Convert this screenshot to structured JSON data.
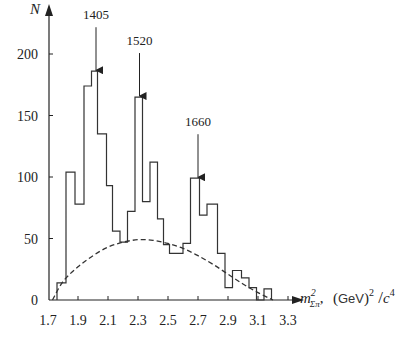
{
  "chart_data": {
    "type": "bar",
    "subtype": "histogram-step",
    "title": "",
    "ylabel": "N",
    "xlabel": "m²_Σπ, (GeV)²/c⁴",
    "xlabel_parts": {
      "symbol": "m",
      "sup": "2",
      "sub": "Σπ",
      "unit": "(GeV)",
      "unit_sup": "2",
      "slash": "/",
      "c": "c",
      "c_sup": "4"
    },
    "xlim": [
      1.7,
      3.4
    ],
    "ylim": [
      0,
      220
    ],
    "x_ticks": [
      "1.7",
      "1.9",
      "2.1",
      "2.3",
      "2.5",
      "2.7",
      "2.9",
      "3.1",
      "3.3"
    ],
    "x_tick_values": [
      1.7,
      1.9,
      2.1,
      2.3,
      2.5,
      2.7,
      2.9,
      3.1,
      3.3
    ],
    "y_ticks": [
      "0",
      "50",
      "100",
      "150",
      "200"
    ],
    "y_tick_values": [
      0,
      50,
      100,
      150,
      200
    ],
    "grid": false,
    "legend": null,
    "bin_edges": [
      1.76,
      1.82,
      1.88,
      1.94,
      1.99,
      2.03,
      2.09,
      2.13,
      2.18,
      2.23,
      2.28,
      2.33,
      2.38,
      2.43,
      2.47,
      2.51,
      2.6,
      2.65,
      2.71,
      2.76,
      2.83,
      2.88,
      2.93,
      2.99,
      3.04,
      3.09,
      3.14,
      3.19
    ],
    "values": [
      14,
      104,
      78,
      174,
      186,
      135,
      93,
      56,
      47,
      72,
      165,
      80,
      112,
      66,
      45,
      38,
      46,
      99,
      69,
      78,
      38,
      10,
      24,
      18,
      10,
      0,
      9
    ],
    "background_curve": {
      "style": "dashed",
      "description": "phase-space background",
      "x": [
        1.73,
        1.8,
        1.9,
        2.0,
        2.1,
        2.2,
        2.3,
        2.4,
        2.5,
        2.6,
        2.7,
        2.8,
        2.9,
        3.0,
        3.1,
        3.2
      ],
      "y": [
        0,
        15,
        27,
        36,
        43,
        47,
        49,
        48.5,
        46,
        42,
        36,
        29,
        21,
        13,
        6,
        0
      ]
    },
    "annotations": [
      {
        "label": "1405",
        "x": 2.02,
        "arrow_to_y": 186
      },
      {
        "label": "1520",
        "x": 2.31,
        "arrow_to_y": 165
      },
      {
        "label": "1660",
        "x": 2.7,
        "arrow_to_y": 99
      }
    ]
  }
}
